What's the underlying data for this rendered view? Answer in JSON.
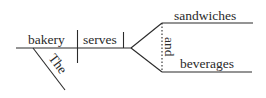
{
  "diagram": {
    "type": "sentence-diagram",
    "style": "Reed-Kellogg",
    "line_color": "#2a2a2a",
    "words": {
      "subject": "bakery",
      "verb": "serves",
      "modifier": "The",
      "object_top": "sandwiches",
      "conjunction": "and",
      "object_bottom": "beverages"
    }
  }
}
